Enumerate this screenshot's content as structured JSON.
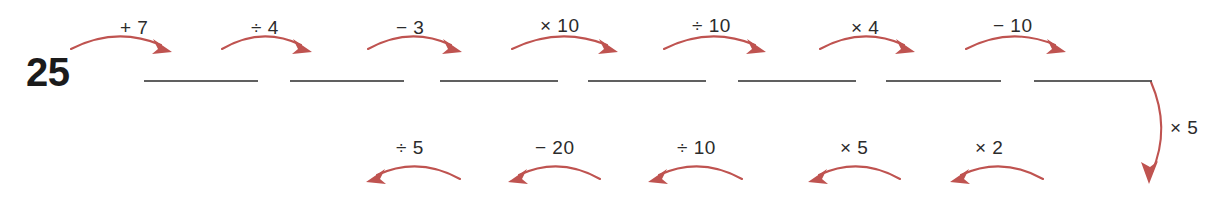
{
  "worksheet": {
    "start_value": "25",
    "arrow_color": "#bf5350",
    "line_color": "#4a4a4a",
    "text_color": "#2b2b2b",
    "background_color": "#ffffff"
  },
  "top_row": {
    "direction": "left-to-right",
    "operations": [
      {
        "label": "+ 7",
        "x": 120,
        "y": 18
      },
      {
        "label": "÷ 4",
        "x": 251,
        "y": 18
      },
      {
        "label": "− 3",
        "x": 396,
        "y": 18
      },
      {
        "label": "× 10",
        "x": 540,
        "y": 16
      },
      {
        "label": "÷ 10",
        "x": 692,
        "y": 16
      },
      {
        "label": "× 4",
        "x": 851,
        "y": 18
      },
      {
        "label": "− 10",
        "x": 993,
        "y": 16
      }
    ],
    "arrows": [
      {
        "x1": 71,
        "x2": 172,
        "name": "arrow-plus-7"
      },
      {
        "x1": 222,
        "x2": 312,
        "name": "arrow-divide-4"
      },
      {
        "x1": 368,
        "x2": 462,
        "name": "arrow-minus-3"
      },
      {
        "x1": 512,
        "x2": 618,
        "name": "arrow-times-10"
      },
      {
        "x1": 664,
        "x2": 766,
        "name": "arrow-divide-10"
      },
      {
        "x1": 820,
        "x2": 915,
        "name": "arrow-times-4"
      },
      {
        "x1": 966,
        "x2": 1066,
        "name": "arrow-minus-10"
      }
    ],
    "blanks": [
      {
        "x": 144,
        "width": 114
      },
      {
        "x": 290,
        "width": 114
      },
      {
        "x": 440,
        "width": 118
      },
      {
        "x": 588,
        "width": 118
      },
      {
        "x": 738,
        "width": 118
      },
      {
        "x": 886,
        "width": 115
      },
      {
        "x": 1034,
        "width": 118
      }
    ],
    "blank_y": 80
  },
  "side_arrow": {
    "label": "× 5",
    "name": "arrow-times-5-down",
    "label_x": 1170,
    "label_y": 118
  },
  "bottom_row": {
    "direction": "right-to-left",
    "operations": [
      {
        "label": "÷ 5",
        "x": 396,
        "y": 138
      },
      {
        "label": "− 20",
        "x": 535,
        "y": 138
      },
      {
        "label": "÷ 10",
        "x": 677,
        "y": 138
      },
      {
        "label": "× 5",
        "x": 840,
        "y": 138
      },
      {
        "label": "× 2",
        "x": 975,
        "y": 138
      }
    ],
    "arrows": [
      {
        "x1": 460,
        "x2": 366,
        "name": "arrow-divide-5-back"
      },
      {
        "x1": 600,
        "x2": 508,
        "name": "arrow-minus-20-back"
      },
      {
        "x1": 742,
        "x2": 648,
        "name": "arrow-divide-10-back"
      },
      {
        "x1": 900,
        "x2": 808,
        "name": "arrow-times-5-back"
      },
      {
        "x1": 1043,
        "x2": 950,
        "name": "arrow-times-2-back"
      }
    ]
  }
}
